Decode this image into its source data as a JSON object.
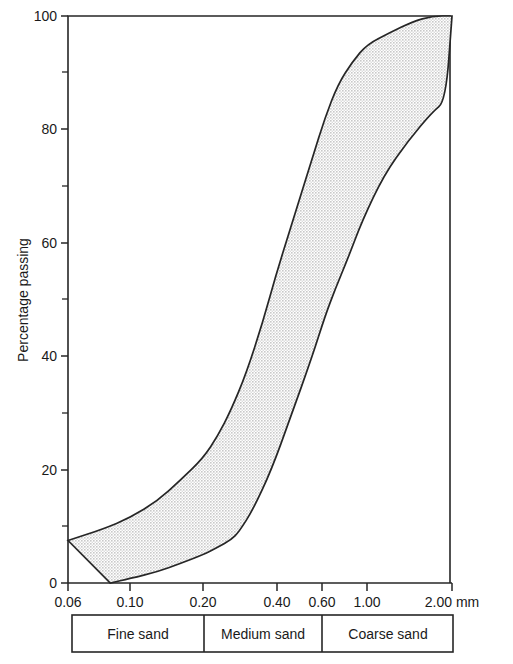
{
  "chart_data": {
    "type": "area",
    "title": "",
    "xlabel": "",
    "ylabel": "Percentage passing",
    "x_unit": "mm",
    "x_scale": "log",
    "xlim": [
      0.06,
      2.0
    ],
    "ylim": [
      0,
      100
    ],
    "grid": false,
    "legend": null,
    "x_tick_labels": [
      "0.06",
      "0.10",
      "0.20",
      "0.40",
      "0.60",
      "1.00",
      "2.00 mm"
    ],
    "x_tick_values": [
      0.06,
      0.1,
      0.2,
      0.4,
      0.6,
      1.0,
      2.0
    ],
    "y_tick_labels": [
      "0",
      "20",
      "40",
      "60",
      "80",
      "100"
    ],
    "y_tick_values": [
      0,
      20,
      40,
      60,
      80,
      100
    ],
    "y_minor_tick_values": [
      10,
      30,
      50,
      70,
      90
    ],
    "series": [
      {
        "name": "Upper envelope (coarsest limit)",
        "x": [
          0.06,
          0.08,
          0.1,
          0.13,
          0.16,
          0.2,
          0.23,
          0.26,
          0.3,
          0.35,
          0.4,
          0.47,
          0.55,
          0.62,
          0.72,
          0.85,
          1.0,
          1.2,
          1.45,
          1.7,
          2.0
        ],
        "values": [
          7.5,
          9.5,
          11.5,
          14.5,
          18.0,
          22.0,
          26.0,
          30.5,
          37.0,
          46.0,
          55.0,
          65.0,
          75.0,
          82.0,
          88.0,
          92.0,
          95.0,
          97.0,
          99.0,
          100.0,
          100.0
        ]
      },
      {
        "name": "Lower envelope (finest limit)",
        "x": [
          0.085,
          0.1,
          0.13,
          0.16,
          0.2,
          0.23,
          0.26,
          0.28,
          0.32,
          0.38,
          0.45,
          0.55,
          0.62,
          0.7,
          0.8,
          0.95,
          1.15,
          1.4,
          1.7,
          1.9,
          2.0
        ],
        "values": [
          0.0,
          0.8,
          2.0,
          3.4,
          5.0,
          6.3,
          7.6,
          9.0,
          13.0,
          20.0,
          29.0,
          40.0,
          47.0,
          52.0,
          57.0,
          64.0,
          72.0,
          78.0,
          83.0,
          85.0,
          100.0
        ]
      }
    ],
    "band_fill_color": "#d7d7d7",
    "band_line_color": "#262626"
  },
  "axes": {
    "y_axis_title": "Percentage passing",
    "x_unit_suffix": "mm"
  },
  "classification_bar": {
    "name": "sand-classification-bar",
    "segments": [
      {
        "label": "Fine sand",
        "from": 0.06,
        "to": 0.2
      },
      {
        "label": "Medium sand",
        "from": 0.2,
        "to": 0.6
      },
      {
        "label": "Coarse sand",
        "from": 0.6,
        "to": 2.0
      }
    ]
  }
}
